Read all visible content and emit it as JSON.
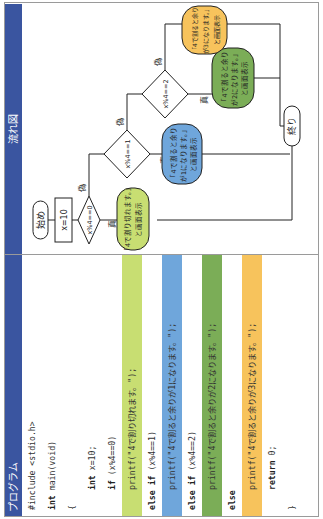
{
  "program": {
    "title": "プログラム",
    "lines": [
      {
        "kw": "",
        "text": "#include <stdio.h>",
        "indent": false,
        "bg": ""
      },
      {
        "kw": "int",
        "text": " main(void)",
        "indent": false,
        "bg": ""
      },
      {
        "kw": "",
        "text": "{",
        "indent": false,
        "bg": ""
      },
      {
        "kw": "int",
        "text": " x=10;",
        "indent": true,
        "bg": ""
      },
      {
        "kw": "if",
        "text": " (x%4==0)",
        "indent": true,
        "bg": ""
      },
      {
        "kw": "",
        "text": "printf(\"4で割り切れます。\");",
        "indent": true,
        "bg": "lime"
      },
      {
        "kw": "else if",
        "text": " (x%4==1)",
        "indent": true,
        "bg": ""
      },
      {
        "kw": "",
        "text": "printf(\"4で割ると余りが1になります。\");",
        "indent": true,
        "bg": "blue"
      },
      {
        "kw": "else if",
        "text": " (x%4==2)",
        "indent": true,
        "bg": ""
      },
      {
        "kw": "",
        "text": "printf(\"4で割ると余りが2になります。\");",
        "indent": true,
        "bg": "green"
      },
      {
        "kw": "else",
        "text": "",
        "indent": true,
        "bg": ""
      },
      {
        "kw": "",
        "text": "printf(\"4で割ると余りが3になります。\");",
        "indent": true,
        "bg": "orange"
      },
      {
        "kw": "return",
        "text": " 0;",
        "indent": true,
        "bg": ""
      },
      {
        "kw": "",
        "text": "}",
        "indent": false,
        "bg": ""
      }
    ]
  },
  "flowchart": {
    "title": "流れ図",
    "start": "始め",
    "assign": "x=10",
    "cond0": "x%4==0",
    "cond1": "x%4==1",
    "cond2": "x%4==2",
    "true_label": "真",
    "false_label": "偽",
    "out0": [
      "「4で割り切れます。」",
      "と画面表示"
    ],
    "out1": [
      "「4で割ると余り",
      "が1になります。」",
      "と画面表示"
    ],
    "out2": [
      "「4で割ると余り",
      "が2になります。」",
      "と画面表示"
    ],
    "out3": [
      "「4で割ると余り",
      "が3になります。」",
      "と画面表示"
    ],
    "end": "終り"
  },
  "colors": {
    "header": "#3a55a0",
    "lime": "#c8de72",
    "blue": "#6fa6db",
    "green": "#7bad57",
    "orange": "#f7c35c"
  }
}
